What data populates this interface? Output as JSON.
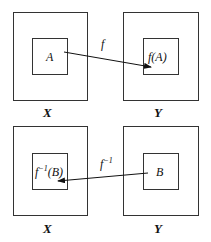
{
  "top": {
    "domain_label": "X",
    "codomain_label": "Y",
    "subset_label": "A",
    "image_label": "f(A)",
    "map_label": "f"
  },
  "bottom": {
    "domain_label": "X",
    "codomain_label": "Y",
    "subset_label": "B",
    "preimage_base": "f",
    "preimage_sup": "−1",
    "preimage_arg": "(B)",
    "map_base": "f",
    "map_sup": "−1"
  },
  "colors": {
    "stroke": "#333333",
    "text": "#111111"
  }
}
